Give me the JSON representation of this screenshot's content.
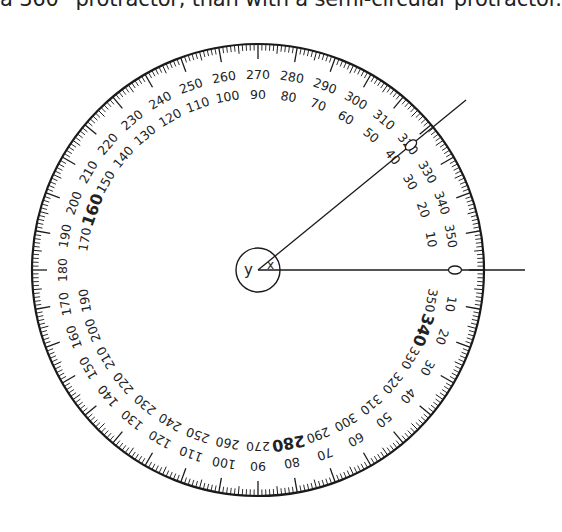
{
  "caption": "a 360° protractor, than with a semi-circular protractor.",
  "chart_data": {
    "type": "diagram",
    "center": [
      258,
      270
    ],
    "outer_radius": 226,
    "center_circle_radius": 22,
    "outer_scale": {
      "description": "Clockwise scale, 0 at right, 90 at bottom, 180 at left, 270 at top",
      "direction": "clockwise",
      "label_radius": 196,
      "labels": [
        0,
        10,
        20,
        30,
        40,
        50,
        60,
        70,
        80,
        90,
        100,
        110,
        120,
        130,
        140,
        150,
        160,
        170,
        180,
        190,
        200,
        210,
        220,
        230,
        240,
        250,
        260,
        270,
        280,
        290,
        300,
        310,
        320,
        330,
        340,
        350
      ],
      "emphasized": []
    },
    "inner_scale": {
      "description": "Counter-clockwise scale, 0 at right, 90 at top, 180 at left, 270 at bottom",
      "direction": "counterclockwise",
      "label_radius": 176,
      "labels": [
        10,
        20,
        30,
        40,
        50,
        60,
        70,
        80,
        90,
        100,
        110,
        120,
        130,
        140,
        150,
        160,
        170,
        190,
        200,
        210,
        220,
        230,
        240,
        250,
        260,
        270,
        280,
        290,
        300,
        310,
        320,
        330,
        340,
        350
      ],
      "emphasized": [
        160,
        280,
        340
      ]
    },
    "ticks": {
      "minor_every_deg": 1,
      "medium_every_deg": 5,
      "major_every_deg": 10
    },
    "rays": [
      {
        "name": "horizontal-ray",
        "angle_deg": 0,
        "end": [
          525,
          270
        ]
      },
      {
        "name": "angled-ray",
        "angle_deg": 40,
        "end": [
          466,
          100
        ]
      }
    ],
    "angle_labels": [
      {
        "text": "x",
        "meaning": "acute angle between rays"
      },
      {
        "text": "y",
        "meaning": "reflex angle around the centre"
      }
    ],
    "zero_markers": [
      "0 on horizontal ray",
      "0 on angled ray near 320/40"
    ]
  }
}
